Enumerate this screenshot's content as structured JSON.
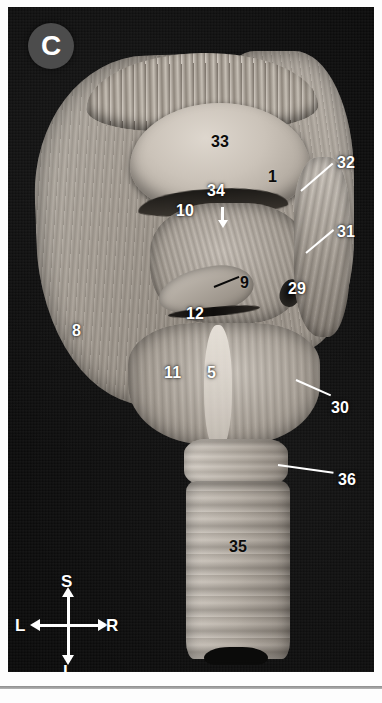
{
  "figure": {
    "panel_label": "C",
    "background_color": "#0a0a0a",
    "label_white_color": "#ffffff",
    "label_black_color": "#0b0b0b",
    "badge_color": "#4c4c4c"
  },
  "labels": [
    {
      "id": "33",
      "text": "33",
      "style": "black",
      "x": 211,
      "y": 134
    },
    {
      "id": "1",
      "text": "1",
      "style": "black",
      "x": 268,
      "y": 169
    },
    {
      "id": "32",
      "text": "32",
      "style": "white",
      "x": 337,
      "y": 155
    },
    {
      "id": "34",
      "text": "34",
      "style": "white",
      "x": 207,
      "y": 183
    },
    {
      "id": "10",
      "text": "10",
      "style": "white",
      "x": 176,
      "y": 203
    },
    {
      "id": "31",
      "text": "31",
      "style": "white",
      "x": 337,
      "y": 224
    },
    {
      "id": "9",
      "text": "9",
      "style": "black",
      "x": 240,
      "y": 275
    },
    {
      "id": "29",
      "text": "29",
      "style": "white",
      "x": 288,
      "y": 281
    },
    {
      "id": "12",
      "text": "12",
      "style": "white",
      "x": 186,
      "y": 306
    },
    {
      "id": "8",
      "text": "8",
      "style": "white",
      "x": 72,
      "y": 323
    },
    {
      "id": "11",
      "text": "11",
      "style": "white",
      "x": 164,
      "y": 365
    },
    {
      "id": "5",
      "text": "5",
      "style": "white",
      "x": 207,
      "y": 365
    },
    {
      "id": "30",
      "text": "30",
      "style": "white",
      "x": 331,
      "y": 400
    },
    {
      "id": "36",
      "text": "36",
      "style": "white",
      "x": 338,
      "y": 472
    },
    {
      "id": "35",
      "text": "35",
      "style": "black",
      "x": 229,
      "y": 539
    }
  ],
  "leader_lines": [
    {
      "id": "lead-32",
      "style": "white",
      "x": 301,
      "y": 190,
      "length": 42,
      "angle": -41
    },
    {
      "id": "lead-31",
      "style": "white",
      "x": 306,
      "y": 252,
      "length": 36,
      "angle": -40
    },
    {
      "id": "lead-9",
      "style": "black",
      "x": 214,
      "y": 286,
      "length": 27,
      "angle": -22
    },
    {
      "id": "lead-30",
      "style": "white",
      "x": 296,
      "y": 379,
      "length": 38,
      "angle": 24
    },
    {
      "id": "lead-36",
      "style": "white",
      "x": 278,
      "y": 464,
      "length": 56,
      "angle": 8
    }
  ],
  "arrow_34": {
    "name": "arrow-down-34",
    "color": "#ffffff"
  },
  "compass": {
    "superior": "S",
    "inferior": "I",
    "left": "L",
    "right": "R",
    "color": "#ffffff"
  }
}
